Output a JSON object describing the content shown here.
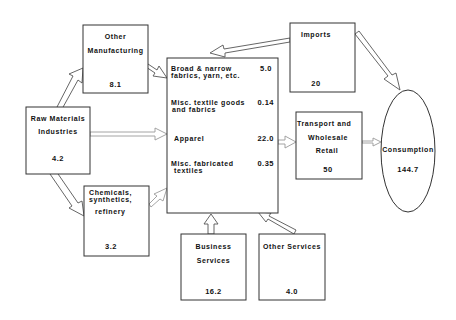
{
  "nodes": {
    "raw_materials": {
      "line1": "Raw Materials",
      "line2": "Industries",
      "value": "4.2"
    },
    "other_manufacturing": {
      "line1": "Other",
      "line2": "Manufacturing",
      "value": "8.1"
    },
    "chemicals": {
      "line1": "Chemicals,",
      "line2": "synthetics,",
      "line3": "refinery",
      "value": "3.2"
    },
    "textiles": {
      "items": [
        {
          "line1": "Broad & narrow",
          "line2": "fabrics, yarn, etc.",
          "value": "5.0"
        },
        {
          "line1": "Misc. textile goods",
          "line2": "and fabrics",
          "value": "0.14"
        },
        {
          "line1": "Apparel",
          "value": "22.0"
        },
        {
          "line1": "Misc. fabricated",
          "line2": "textiles",
          "value": "0.35"
        }
      ]
    },
    "imports": {
      "line1": "Imports",
      "value": "20"
    },
    "transport": {
      "line1": "Transport and",
      "line2": "Wholesale",
      "line3": "Retail",
      "value": "50"
    },
    "consumption": {
      "line1": "Consumption",
      "value": "144.7"
    },
    "business_services": {
      "line1": "Business",
      "line2": "Services",
      "value": "16.2"
    },
    "other_services": {
      "line1": "Other Services",
      "value": "4.0"
    }
  },
  "edges": [
    {
      "from": "Raw Materials Industries",
      "to": "Other Manufacturing"
    },
    {
      "from": "Raw Materials Industries",
      "to": "Textiles"
    },
    {
      "from": "Raw Materials Industries",
      "to": "Chemicals, synthetics, refinery"
    },
    {
      "from": "Other Manufacturing",
      "to": "Textiles"
    },
    {
      "from": "Chemicals, synthetics, refinery",
      "to": "Textiles"
    },
    {
      "from": "Imports",
      "to": "Textiles"
    },
    {
      "from": "Imports",
      "to": "Consumption"
    },
    {
      "from": "Textiles",
      "to": "Transport and Wholesale Retail"
    },
    {
      "from": "Transport and Wholesale Retail",
      "to": "Consumption"
    },
    {
      "from": "Business Services",
      "to": "Textiles"
    },
    {
      "from": "Other Services",
      "to": "Textiles"
    }
  ]
}
